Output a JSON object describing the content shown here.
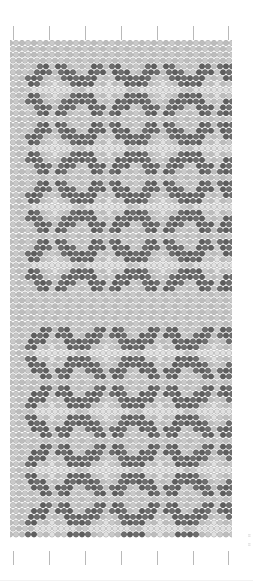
{
  "document": {
    "title": "Beadwork Pattern Chart",
    "kind": "bead-loom-grid"
  },
  "grid": {
    "left": 10,
    "top": 40,
    "width": 222,
    "height": 510,
    "columns": 37,
    "rows": 85,
    "cell": 6,
    "bead_radius": 2.7,
    "offset_rows": true
  },
  "colors": {
    "background": "#ffffff",
    "bead_light": "#c9c9c9",
    "bead_light_alt": "#bdbdbd",
    "bead_highlight": "#e0e0e0",
    "bead_dark": "#6e6e6e",
    "bead_dark_alt": "#5f5f5f",
    "bead_outline": "#a8a8a8",
    "bead_outline_dark": "#555555",
    "tick": "#b9b9b9",
    "caption": "#cfcfcf"
  },
  "ticks": {
    "count": 7,
    "top_y": 26,
    "bottom_y": 551,
    "x_positions": [
      13,
      49,
      85,
      121,
      157,
      193,
      228
    ]
  },
  "caption": {
    "line1": "≡",
    "line2": "≡"
  },
  "chart_data": {
    "type": "heatmap",
    "xlabel": "",
    "ylabel": "",
    "legend": [
      {
        "name": "background bead",
        "color": "#c9c9c9"
      },
      {
        "name": "motif bead",
        "color": "#6e6e6e"
      },
      {
        "name": "highlight bead",
        "color": "#e0e0e0"
      }
    ],
    "motif": {
      "name": "diamond-floral",
      "unit_width": 9,
      "unit_height": 9,
      "mask": [
        "..DD.DD..",
        ".DDD.DDD.",
        "DDD...DDD",
        "DD..H..DD",
        ".HHHHHHH.",
        "DD..H..DD",
        "DDD...DDD",
        ".DDD.DDD.",
        "..DD.DD.."
      ]
    },
    "blocks": [
      {
        "name": "upper-block",
        "rows": 38,
        "row_start": 0,
        "motif_rows": 4,
        "motif_cols": 4,
        "col_origins": [
          3,
          12,
          21,
          30
        ],
        "row_origins": [
          4,
          14,
          24,
          34
        ]
      },
      {
        "name": "lower-block",
        "rows": 38,
        "row_start": 47,
        "motif_rows": 4,
        "motif_cols": 4,
        "col_origins": [
          3,
          12,
          21,
          30
        ],
        "row_origins": [
          49,
          59,
          69,
          79
        ]
      }
    ],
    "separator": {
      "name": "plain-band",
      "row_start": 41,
      "row_end": 47
    }
  }
}
